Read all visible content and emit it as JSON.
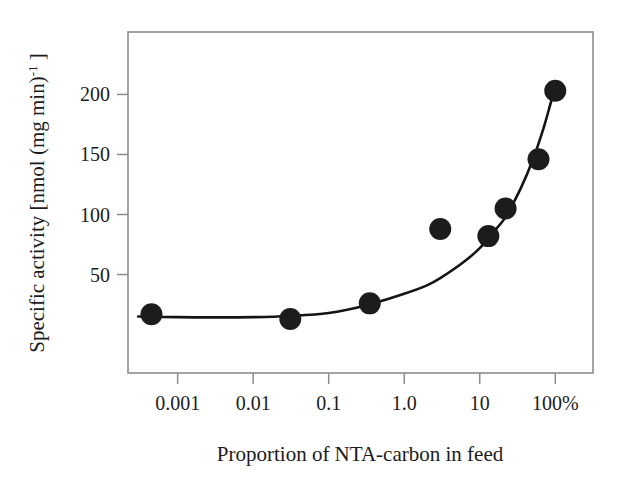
{
  "figure": {
    "caption_none": "",
    "background_color": "#ffffff",
    "frame_color": "#8c8c8c",
    "marker_color": "#1c1c1c",
    "curve_color": "#141414"
  },
  "axes": {
    "x": {
      "label": "Proportion of NTA-carbon in feed",
      "scale": "log",
      "tick_labels": [
        "0.001",
        "0.01",
        "0.1",
        "1.0",
        "10",
        "100%"
      ],
      "tick_values": [
        0.001,
        0.01,
        0.1,
        1.0,
        10,
        100
      ],
      "range": [
        0.00022,
        316
      ]
    },
    "y": {
      "label_main": "Specific activity [nmol (mg min)",
      "label_sup": "-1",
      "label_tail": " ]",
      "label_full": "Specific activity [nmol (mg min)-1 ]",
      "scale": "linear",
      "tick_labels": [
        "50",
        "100",
        "150",
        "200"
      ],
      "tick_values": [
        50,
        100,
        150,
        200
      ],
      "range": [
        -32,
        252
      ]
    }
  },
  "chart_data": {
    "type": "scatter",
    "title": "",
    "subtitle": "",
    "xlabel": "Proportion of NTA-carbon in feed",
    "ylabel": "Specific activity [nmol (mg min)-1 ]",
    "xscale": "log",
    "yscale": "linear",
    "xlim": [
      0.00022,
      316
    ],
    "ylim": [
      -32,
      252
    ],
    "xticks": [
      0.001,
      0.01,
      0.1,
      1.0,
      10,
      100
    ],
    "xticklabels": [
      "0.001",
      "0.01",
      "0.1",
      "1.0",
      "10",
      "100%"
    ],
    "yticks": [
      50,
      100,
      150,
      200
    ],
    "yticklabels": [
      "50",
      "100",
      "150",
      "200"
    ],
    "grid": false,
    "legend": null,
    "legend_position": "none",
    "annotations": [],
    "x": [
      0.00045,
      0.031,
      0.35,
      3.0,
      13.0,
      22.0,
      60.0,
      100.0
    ],
    "y": [
      17,
      13,
      26,
      88,
      82,
      105,
      146,
      203
    ],
    "points": [
      {
        "x": 0.00045,
        "y": 17
      },
      {
        "x": 0.031,
        "y": 13
      },
      {
        "x": 0.35,
        "y": 26
      },
      {
        "x": 3.0,
        "y": 88
      },
      {
        "x": 13.0,
        "y": 82
      },
      {
        "x": 22.0,
        "y": 105
      },
      {
        "x": 60.0,
        "y": 146
      },
      {
        "x": 100.0,
        "y": 203
      }
    ],
    "marker": {
      "shape": "circle",
      "size_px": 22,
      "color": "#1c1c1c"
    },
    "fit_curve": {
      "name": "fitted trend",
      "style": "solid",
      "color": "#141414",
      "width_px": 2.6,
      "x": [
        0.0003,
        0.001,
        0.003,
        0.01,
        0.03,
        0.1,
        0.3,
        1.0,
        2.0,
        3.0,
        6.0,
        10.0,
        16.0,
        22.0,
        35.0,
        50.0,
        70.0,
        90.0,
        100.0
      ],
      "y": [
        15,
        14.5,
        14.3,
        14.5,
        15.5,
        18,
        24,
        34,
        41,
        47,
        60,
        72,
        87,
        98,
        122,
        145,
        172,
        196,
        203
      ]
    }
  }
}
